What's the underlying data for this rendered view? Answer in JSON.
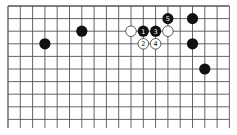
{
  "board": {
    "type": "go-board-fragment",
    "columns_x": [
      8,
      20.3,
      32.6,
      44.9,
      57.2,
      69.5,
      81.8,
      94.1,
      106.4,
      118.7,
      131,
      143.3,
      155.6,
      167.9,
      180.2,
      192.5,
      204.8,
      217.1,
      229.4
    ],
    "rows_y": [
      6,
      18.6,
      31.2,
      43.8,
      56.4,
      69,
      81.6,
      94.2,
      106.8,
      119.4
    ],
    "top_edge": true,
    "left_edge": true,
    "line_extend_bottom": 128,
    "colors": {
      "line": "#555555",
      "black_stone": "#111111",
      "white_stone": "#ffffff",
      "white_stone_border": "#333333"
    },
    "stones": [
      {
        "color": "black",
        "col": 3,
        "row": 3,
        "label": ""
      },
      {
        "color": "black",
        "col": 6,
        "row": 2,
        "label": ""
      },
      {
        "color": "white",
        "col": 10,
        "row": 2,
        "label": ""
      },
      {
        "color": "black",
        "col": 11,
        "row": 2,
        "label": "1"
      },
      {
        "color": "black",
        "col": 12,
        "row": 2,
        "label": "3"
      },
      {
        "color": "white",
        "col": 13,
        "row": 2,
        "label": ""
      },
      {
        "color": "white",
        "col": 11,
        "row": 3,
        "label": "2"
      },
      {
        "color": "white",
        "col": 12,
        "row": 3,
        "label": "4"
      },
      {
        "color": "black",
        "col": 13,
        "row": 1,
        "label": "5"
      },
      {
        "color": "black",
        "col": 15,
        "row": 1,
        "label": ""
      },
      {
        "color": "black",
        "col": 15,
        "row": 3,
        "label": ""
      },
      {
        "color": "black",
        "col": 16,
        "row": 5,
        "label": ""
      }
    ]
  }
}
